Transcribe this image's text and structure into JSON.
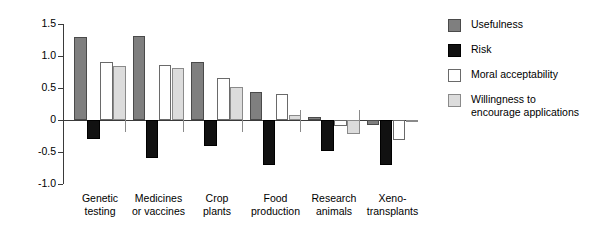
{
  "chart_data": {
    "type": "bar",
    "title": "",
    "xlabel": "",
    "ylabel": "Negative/positive evaluation",
    "ylim": [
      -1.0,
      1.5
    ],
    "yticks": [
      "1.5",
      "1.0",
      "0.5",
      "0",
      "-0.5",
      "-1.0"
    ],
    "ytick_values": [
      1.5,
      1.0,
      0.5,
      0,
      -0.5,
      -1.0
    ],
    "grid": false,
    "legend_position": "right",
    "categories": [
      "Genetic\ntesting",
      "Medicines\nor vaccines",
      "Crop\nplants",
      "Food\nproduction",
      "Research\nanimals",
      "Xeno-\ntransplants"
    ],
    "series": [
      {
        "name": "Usefulness",
        "color": "#7f7f7f",
        "values": [
          1.3,
          1.32,
          0.9,
          0.44,
          0.04,
          -0.08
        ]
      },
      {
        "name": "Risk",
        "color": "#111111",
        "values": [
          -0.3,
          -0.59,
          -0.4,
          -0.7,
          -0.48,
          -0.7
        ]
      },
      {
        "name": "Moral acceptability",
        "color": "#ffffff",
        "values": [
          0.9,
          0.86,
          0.65,
          0.4,
          -0.1,
          -0.32
        ]
      },
      {
        "name": "Willingness to\nencourage applications",
        "color": "#dcdcdc",
        "values": [
          0.84,
          0.82,
          0.52,
          0.08,
          -0.22,
          -0.02
        ]
      }
    ]
  },
  "legend": {
    "items": [
      {
        "label": "Usefulness"
      },
      {
        "label": "Risk"
      },
      {
        "label": "Moral acceptability"
      },
      {
        "label": "Willingness to\nencourage applications"
      }
    ]
  }
}
